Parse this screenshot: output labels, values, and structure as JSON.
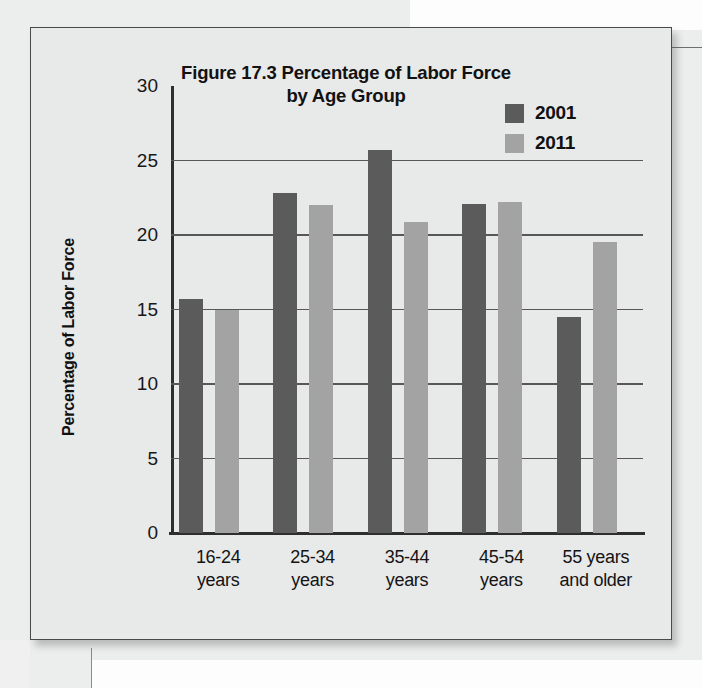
{
  "figure": {
    "title_line1": "Figure 17.3 Percentage of Labor Force",
    "title_line2": "by Age Group",
    "y_axis_title": "Percentage of Labor Force"
  },
  "colors": {
    "series_2001": "#5b5b5b",
    "series_2011": "#a3a3a3",
    "axis": "#2e2e2e",
    "gridline": "#575757",
    "frame_background": "#e8e9e9",
    "page_background": "#eceded"
  },
  "chart_data": {
    "type": "bar",
    "title": "Figure 17.3 Percentage of Labor Force by Age Group",
    "xlabel": "",
    "ylabel": "Percentage of Labor Force",
    "ylim": [
      0,
      30
    ],
    "yticks": [
      0,
      5,
      10,
      15,
      20,
      25,
      30
    ],
    "ytick_labels": [
      "0",
      "5",
      "10",
      "15",
      "20",
      "25",
      "30"
    ],
    "grid": true,
    "legend_position": "top-right",
    "categories": [
      "16-24 years",
      "25-34 years",
      "35-44 years",
      "45-54 years",
      "55 years and older"
    ],
    "category_lines": [
      [
        "16-24",
        "years"
      ],
      [
        "25-34",
        "years"
      ],
      [
        "35-44",
        "years"
      ],
      [
        "45-54",
        "years"
      ],
      [
        "55 years",
        "and older"
      ]
    ],
    "series": [
      {
        "name": "2001",
        "color": "#5b5b5b",
        "values": [
          15.7,
          22.8,
          25.7,
          22.1,
          14.5
        ]
      },
      {
        "name": "2011",
        "color": "#a3a3a3",
        "values": [
          15.0,
          22.0,
          20.9,
          22.2,
          19.5
        ]
      }
    ]
  }
}
